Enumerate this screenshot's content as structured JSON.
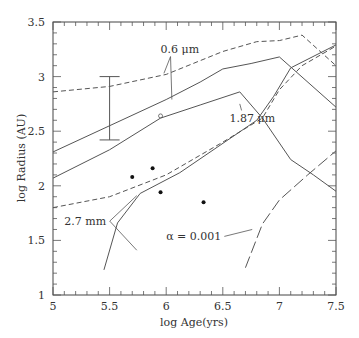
{
  "chart_data": {
    "type": "line",
    "title": "",
    "xlabel": "log Age(yrs)",
    "ylabel": "log Radius (AU)",
    "xlim": [
      5,
      7.5
    ],
    "ylim": [
      1,
      3.5
    ],
    "xticks": [
      "5",
      "5.5",
      "6",
      "6.5",
      "7",
      "7.5"
    ],
    "xtick_values": [
      5,
      5.5,
      6,
      6.5,
      7,
      7.5
    ],
    "yticks": [
      "1",
      "1.5",
      "2",
      "2.5",
      "3",
      "3.5"
    ],
    "ytick_values": [
      1,
      1.5,
      2,
      2.5,
      3,
      3.5
    ],
    "grid": false,
    "series": [
      {
        "name": "0.6 um (dashed)",
        "style": "dashed",
        "x": [
          5,
          5.5,
          6,
          6.5,
          6.8,
          7.0,
          7.2,
          7.5
        ],
        "y": [
          2.86,
          2.91,
          3.02,
          3.23,
          3.32,
          3.33,
          3.38,
          3.1
        ]
      },
      {
        "name": "0.6 um",
        "style": "solid",
        "x": [
          5,
          5.5,
          6,
          6.3,
          6.5,
          6.75,
          7.0,
          7.5
        ],
        "y": [
          2.31,
          2.55,
          2.79,
          2.95,
          3.07,
          3.12,
          3.18,
          2.72
        ]
      },
      {
        "name": "1.87 um",
        "style": "solid",
        "x": [
          5,
          5.5,
          5.95,
          6.3,
          6.65,
          6.85,
          7.1,
          7.3,
          7.5
        ],
        "y": [
          2.07,
          2.33,
          2.62,
          2.74,
          2.86,
          2.62,
          2.24,
          2.1,
          1.95
        ]
      },
      {
        "name": "2.7 mm (dashed)",
        "style": "dashed",
        "x": [
          5,
          5.5,
          6,
          6.5,
          6.85,
          7.0,
          7.2,
          7.5
        ],
        "y": [
          1.8,
          1.9,
          2.1,
          2.4,
          2.62,
          2.88,
          3.1,
          3.28
        ]
      },
      {
        "name": "2.7 mm",
        "style": "solid",
        "x": [
          5.45,
          5.57,
          5.77,
          6.12,
          6.8,
          6.95,
          7.1,
          7.5
        ],
        "y": [
          1.23,
          1.66,
          1.93,
          2.12,
          2.6,
          2.82,
          3.08,
          3.29
        ]
      },
      {
        "name": "alpha = 0.001",
        "style": "longdash",
        "x": [
          6.7,
          6.85,
          7.0,
          7.25,
          7.5
        ],
        "y": [
          1.25,
          1.65,
          1.87,
          2.1,
          2.32
        ]
      }
    ],
    "points_filled": [
      {
        "x": 5.7,
        "y": 2.08
      },
      {
        "x": 5.88,
        "y": 2.16
      },
      {
        "x": 5.95,
        "y": 1.94
      },
      {
        "x": 6.33,
        "y": 1.85
      }
    ],
    "points_open": [
      {
        "x": 5.95,
        "y": 2.64
      }
    ],
    "error_bar": {
      "x": 5.5,
      "low": 2.42,
      "high": 3.0
    },
    "annotations": [
      {
        "text": "0.6  μm",
        "x": 5.95,
        "y": 3.22,
        "targets": [
          [
            5.98,
            3.03
          ],
          [
            6.05,
            2.79
          ]
        ]
      },
      {
        "text": "1.87  μm",
        "x": 6.56,
        "y": 2.58,
        "target": [
          6.65,
          2.75
        ]
      },
      {
        "text": "2.7 mm",
        "x": 5.1,
        "y": 1.64,
        "targets": [
          [
            5.74,
            1.91
          ],
          [
            5.74,
            1.41
          ]
        ]
      },
      {
        "text": "α  =  0.001",
        "x": 6.0,
        "y": 1.5,
        "target": [
          6.76,
          1.6
        ]
      }
    ]
  }
}
